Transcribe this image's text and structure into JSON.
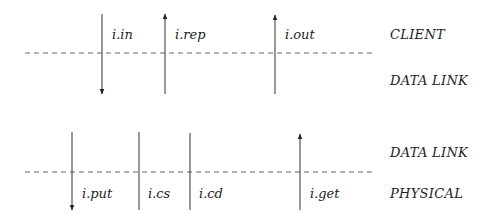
{
  "diagram": {
    "top": {
      "boundary_y": 53,
      "layers": [
        {
          "label": "CLIENT",
          "x": 390,
          "y": 28
        },
        {
          "label": "DATA LINK",
          "x": 390,
          "y": 74
        }
      ],
      "signals": [
        {
          "label": "i.in",
          "x": 102,
          "direction": "down",
          "label_x": 112,
          "label_y": 28
        },
        {
          "label": "i.rep",
          "x": 165,
          "direction": "up",
          "label_x": 175,
          "label_y": 28
        },
        {
          "label": "i.out",
          "x": 275,
          "direction": "up",
          "label_x": 285,
          "label_y": 28
        }
      ]
    },
    "bottom": {
      "boundary_y": 172,
      "layers": [
        {
          "label": "DATA LINK",
          "x": 390,
          "y": 146
        },
        {
          "label": "PHYSICAL",
          "x": 390,
          "y": 187
        }
      ],
      "signals": [
        {
          "label": "i.put",
          "x": 72,
          "direction": "down",
          "label_x": 82,
          "label_y": 187
        },
        {
          "label": "i.cs",
          "x": 139,
          "direction": "none",
          "label_x": 148,
          "label_y": 187
        },
        {
          "label": "i.cd",
          "x": 190,
          "direction": "none",
          "label_x": 199,
          "label_y": 187
        },
        {
          "label": "i.get",
          "x": 300,
          "direction": "up",
          "label_x": 310,
          "label_y": 187
        }
      ]
    }
  }
}
